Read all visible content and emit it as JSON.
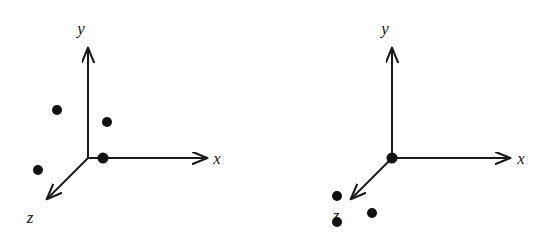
{
  "figure": {
    "background_color": "#ffffff",
    "stroke_color": "#1a1a1a",
    "point_color": "#111111",
    "width": 548,
    "height": 241
  },
  "panels": [
    {
      "id": "left",
      "name": "left-axes-diagram",
      "origin": {
        "x": 88,
        "y": 158
      },
      "axes": [
        {
          "name": "y-axis",
          "label": "y",
          "label_pos": {
            "x": 87,
            "y": 34
          },
          "from": {
            "x": 88,
            "y": 158
          },
          "to": {
            "x": 88,
            "y": 48
          },
          "arrow": true
        },
        {
          "name": "x-axis",
          "label": "x",
          "label_pos": {
            "x": 217,
            "y": 163
          },
          "from": {
            "x": 88,
            "y": 158
          },
          "to": {
            "x": 207,
            "y": 158
          },
          "arrow": true
        },
        {
          "name": "z-axis",
          "label": "z",
          "label_pos": {
            "x": 28,
            "y": 221
          },
          "from": {
            "x": 88,
            "y": 158
          },
          "to": {
            "x": 46,
            "y": 200
          },
          "arrow": true
        }
      ],
      "points": [
        {
          "name": "point-upper-left",
          "x": 57,
          "y": 110,
          "r": 5
        },
        {
          "name": "point-upper-right",
          "x": 107,
          "y": 122,
          "r": 5
        },
        {
          "name": "point-lower-left",
          "x": 38,
          "y": 170,
          "r": 5
        },
        {
          "name": "point-at-origin",
          "x": 103,
          "y": 158,
          "r": 5.5
        }
      ]
    },
    {
      "id": "right",
      "name": "right-axes-diagram",
      "origin": {
        "x": 118,
        "y": 158
      },
      "axes": [
        {
          "name": "y-axis",
          "label": "y",
          "label_pos": {
            "x": 117,
            "y": 34
          },
          "from": {
            "x": 118,
            "y": 158
          },
          "to": {
            "x": 118,
            "y": 48
          },
          "arrow": true
        },
        {
          "name": "x-axis",
          "label": "x",
          "label_pos": {
            "x": 247,
            "y": 163
          },
          "from": {
            "x": 118,
            "y": 158
          },
          "to": {
            "x": 236,
            "y": 158
          },
          "arrow": true
        },
        {
          "name": "z-axis",
          "label": "z",
          "label_pos": {
            "x": 58,
            "y": 219
          },
          "from": {
            "x": 118,
            "y": 158
          },
          "to": {
            "x": 76,
            "y": 200
          },
          "arrow": true
        }
      ],
      "points": [
        {
          "name": "point-at-origin",
          "x": 118,
          "y": 158,
          "r": 5.5
        },
        {
          "name": "point-above-z-label",
          "x": 63,
          "y": 196,
          "r": 5
        },
        {
          "name": "point-on-z-label",
          "x": 63,
          "y": 221,
          "r": 5
        },
        {
          "name": "point-right-of-z-label",
          "x": 98,
          "y": 213,
          "r": 5
        }
      ]
    }
  ]
}
